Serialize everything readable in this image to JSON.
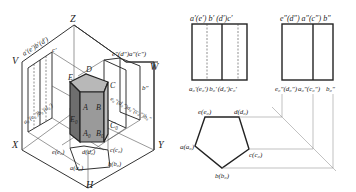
{
  "figure": {
    "axes": {
      "z": "Z",
      "x": "X",
      "y": "Y",
      "v_plane": "V",
      "w_plane": "W",
      "h_plane": "H"
    },
    "iso_prism_labels": {
      "top": [
        "A",
        "B",
        "C",
        "D",
        "E"
      ],
      "bottom": [
        "A₀",
        "B₀",
        "C₀",
        "E₀"
      ]
    },
    "iso_v_labels": {
      "top": "a′(e′)b′(d′)",
      "c": "c′",
      "bottom": "a₀′(e₀′)b₀′(d₀′)"
    },
    "iso_w_labels": {
      "top": "e″(d″)a″(c″)",
      "w": "W",
      "b": "b″",
      "bottom": "e₀″(d₀″)a₀″(c₀″)b₀″"
    },
    "iso_h_labels": {
      "e": "e(e₀)",
      "d": "d(d₀)",
      "c": "c(c₀)",
      "b": "b(b₀)",
      "a": "a(a₀)"
    },
    "front_view": {
      "top_labels": [
        "a′",
        "(e′)",
        "b′",
        "(d′)",
        "c′"
      ],
      "bottom_labels": [
        "a₀′",
        "(e₀′)",
        "b₀′",
        "(d₀′)",
        "c₀′"
      ]
    },
    "side_view": {
      "top_labels": [
        "e″",
        "(d″)",
        "a″",
        "(c″)",
        "b″"
      ],
      "bottom_labels": [
        "e₀″",
        "(d₀″)",
        "a₀″",
        "(c₀″)",
        "b₀″"
      ]
    },
    "top_view": {
      "labels": {
        "e": "e(e₀)",
        "d": "d(d₀)",
        "a": "a(a₀)",
        "c": "c(c₀)",
        "b": "b(b₀)"
      }
    },
    "colors": {
      "line": "#222222",
      "face_top": "#b8b8b8",
      "face_side_dark": "#6e6e6e",
      "face_side_mid": "#9a9a9a",
      "projection": "#999999"
    }
  }
}
